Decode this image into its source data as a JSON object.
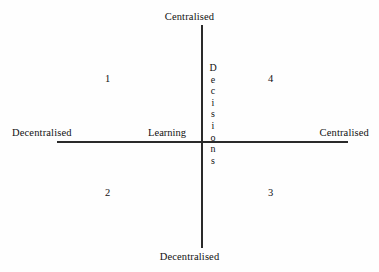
{
  "diagram": {
    "vertical_axis": {
      "name": "Decisions",
      "name_letters": [
        "D",
        "e",
        "c",
        "i",
        "s",
        "i",
        "o",
        "n",
        "s"
      ],
      "top_pole": "Centralised",
      "bottom_pole": "Decentralised"
    },
    "horizontal_axis": {
      "name": "Learning",
      "left_pole": "Decentralised",
      "right_pole": "Centralised"
    },
    "quadrants": [
      {
        "id": "top-left",
        "label": "1"
      },
      {
        "id": "top-right",
        "label": "4"
      },
      {
        "id": "bottom-left",
        "label": "2"
      },
      {
        "id": "bottom-right",
        "label": "3"
      }
    ],
    "colors": {
      "background": "#fefefe",
      "line": "#2a2a2a",
      "text": "#111111"
    }
  },
  "chart_data": {
    "type": "scatter",
    "title": "",
    "xlabel": "Learning",
    "ylabel": "Decisions",
    "x_tick_labels": [
      "Decentralised",
      "Centralised"
    ],
    "y_tick_labels": [
      "Decentralised",
      "Centralised"
    ],
    "grid": false,
    "legend": "none",
    "xlim": [
      -1,
      1
    ],
    "ylim": [
      -1,
      1
    ],
    "annotations": [
      {
        "text": "1",
        "x": -0.5,
        "y": 0.5,
        "quadrant": "top-left"
      },
      {
        "text": "4",
        "x": 0.55,
        "y": 0.5,
        "quadrant": "top-right"
      },
      {
        "text": "2",
        "x": -0.5,
        "y": -0.45,
        "quadrant": "bottom-left"
      },
      {
        "text": "3",
        "x": 0.55,
        "y": -0.45,
        "quadrant": "bottom-right"
      }
    ]
  }
}
